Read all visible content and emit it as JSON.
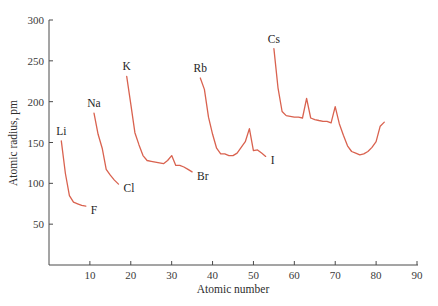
{
  "chart_data": {
    "type": "line",
    "title": "",
    "xlabel": "Atomic number",
    "ylabel": "Atomic radius, pm",
    "xlim": [
      0,
      90
    ],
    "ylim": [
      0,
      300
    ],
    "xticks": [
      10,
      20,
      30,
      40,
      50,
      60,
      70,
      80,
      90
    ],
    "yticks": [
      50,
      100,
      150,
      200,
      250,
      300
    ],
    "grid": false,
    "legend": null,
    "line_color": "#d9624f",
    "series": [
      {
        "name": "Period 2",
        "start_label": "Li",
        "end_label": "F",
        "x": [
          3,
          4,
          5,
          6,
          7,
          8,
          9
        ],
        "values": [
          152,
          112,
          85,
          77,
          75,
          73,
          72
        ]
      },
      {
        "name": "Period 3",
        "start_label": "Na",
        "end_label": "Cl",
        "x": [
          11,
          12,
          13,
          14,
          15,
          16,
          17
        ],
        "values": [
          186,
          160,
          143,
          117,
          110,
          104,
          99
        ]
      },
      {
        "name": "Period 4",
        "start_label": "K",
        "end_label": "Br",
        "x": [
          19,
          20,
          21,
          22,
          23,
          24,
          25,
          26,
          27,
          28,
          29,
          30,
          31,
          32,
          33,
          34,
          35
        ],
        "values": [
          231,
          197,
          162,
          147,
          134,
          128,
          127,
          126,
          125,
          124,
          128,
          134,
          122,
          122,
          120,
          117,
          114
        ]
      },
      {
        "name": "Period 5",
        "start_label": "Rb",
        "end_label": "I",
        "x": [
          37,
          38,
          39,
          40,
          41,
          42,
          43,
          44,
          45,
          46,
          47,
          48,
          49,
          50,
          51,
          52,
          53
        ],
        "values": [
          229,
          215,
          181,
          160,
          143,
          136,
          136,
          134,
          134,
          137,
          144,
          151,
          167,
          140,
          141,
          137,
          133
        ]
      },
      {
        "name": "Period 6",
        "start_label": "Cs",
        "end_label": "",
        "x": [
          55,
          56,
          57,
          58,
          59,
          60,
          61,
          62,
          63,
          64,
          65,
          66,
          67,
          68,
          69,
          70,
          71,
          72,
          73,
          74,
          75,
          76,
          77,
          78,
          79,
          80,
          81,
          82
        ],
        "values": [
          265,
          217,
          188,
          183,
          182,
          181,
          181,
          180,
          204,
          180,
          178,
          177,
          176,
          176,
          174,
          194,
          173,
          159,
          146,
          139,
          137,
          135,
          136,
          139,
          144,
          151,
          170,
          175
        ]
      }
    ],
    "annotations": [
      {
        "text": "Li",
        "x": 3,
        "y": 152,
        "pos": "above"
      },
      {
        "text": "F",
        "x": 9,
        "y": 72,
        "pos": "right"
      },
      {
        "text": "Na",
        "x": 11,
        "y": 186,
        "pos": "above"
      },
      {
        "text": "Cl",
        "x": 17,
        "y": 99,
        "pos": "right"
      },
      {
        "text": "K",
        "x": 19,
        "y": 231,
        "pos": "above"
      },
      {
        "text": "Br",
        "x": 35,
        "y": 114,
        "pos": "right"
      },
      {
        "text": "Rb",
        "x": 37,
        "y": 229,
        "pos": "above"
      },
      {
        "text": "I",
        "x": 53,
        "y": 133,
        "pos": "right"
      },
      {
        "text": "Cs",
        "x": 55,
        "y": 265,
        "pos": "above"
      }
    ]
  },
  "axes": {
    "x_title": "Atomic number",
    "y_title": "Atomic radius, pm"
  }
}
